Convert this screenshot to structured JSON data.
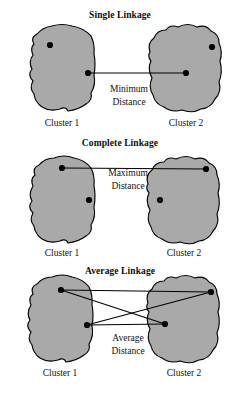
{
  "figure": {
    "background_color": "#ffffff",
    "blob_fill_color": "#a9a9a9",
    "blob_stroke_color": "#000000",
    "line_color": "#000000",
    "point_color": "#000000",
    "text_color": "#111111"
  },
  "panels": [
    {
      "id": "single-linkage",
      "title": "Single Linkage",
      "distance_label_line1": "Minimum",
      "distance_label_line2": "Distance",
      "left_cluster_label": "Cluster 1",
      "right_cluster_label": "Cluster 2",
      "points": [
        {
          "name": "left-outlier-point",
          "x": 50,
          "y": 45
        },
        {
          "name": "left-nearest-point",
          "x": 88,
          "y": 73
        },
        {
          "name": "right-nearest-point",
          "x": 186,
          "y": 73
        },
        {
          "name": "right-outlier-point",
          "x": 212,
          "y": 47
        }
      ],
      "connections": [
        {
          "name": "minimum-distance-line",
          "x1": 88,
          "y1": 73,
          "x2": 186,
          "y2": 73
        }
      ]
    },
    {
      "id": "complete-linkage",
      "title": "Complete Linkage",
      "distance_label_line1": "Maximum",
      "distance_label_line2": "Distance",
      "left_cluster_label": "Cluster 1",
      "right_cluster_label": "Cluster 2",
      "points": [
        {
          "name": "left-farthest-point",
          "x": 62,
          "y": 168
        },
        {
          "name": "left-inner-point",
          "x": 89,
          "y": 200
        },
        {
          "name": "right-inner-point",
          "x": 160,
          "y": 200
        },
        {
          "name": "right-farthest-point",
          "x": 206,
          "y": 169
        }
      ],
      "connections": [
        {
          "name": "maximum-distance-line",
          "x1": 62,
          "y1": 168,
          "x2": 206,
          "y2": 169
        }
      ]
    },
    {
      "id": "average-linkage",
      "title": "Average Linkage",
      "distance_label_line1": "Average",
      "distance_label_line2": "Distance",
      "left_cluster_label": "Cluster 1",
      "right_cluster_label": "Cluster 2",
      "points": [
        {
          "name": "left-top-point",
          "x": 61,
          "y": 290
        },
        {
          "name": "left-bottom-point",
          "x": 87,
          "y": 325
        },
        {
          "name": "right-bottom-point",
          "x": 165,
          "y": 324
        },
        {
          "name": "right-top-point",
          "x": 211,
          "y": 292
        }
      ],
      "connections": [
        {
          "name": "pair-line-top-top",
          "x1": 61,
          "y1": 290,
          "x2": 211,
          "y2": 292
        },
        {
          "name": "pair-line-top-bottom",
          "x1": 61,
          "y1": 290,
          "x2": 165,
          "y2": 324
        },
        {
          "name": "pair-line-bottom-top",
          "x1": 87,
          "y1": 325,
          "x2": 211,
          "y2": 292
        },
        {
          "name": "pair-line-bottom-bottom",
          "x1": 87,
          "y1": 325,
          "x2": 165,
          "y2": 324
        }
      ]
    }
  ],
  "geometry": {
    "point_radius": 3.1,
    "blob_paths": {
      "single_left": "M 33 55 Q 30 48 34 44 Q 30 38 37 34 Q 43 27 52 26 Q 62 23 72 26 Q 84 28 91 36 Q 95 44 94 54 Q 96 64 94 75 Q 96 85 91 93 Q 93 100 86 104 Q 78 110 68 111 Q 66 106 60 109 Q 50 112 42 107 Q 35 102 34 94 Q 29 88 33 81 Q 27 75 32 69 Q 28 62 33 55 Z",
      "single_right": "M 150 52 Q 147 43 154 38 Q 157 30 166 30 Q 170 24 178 27 Q 188 22 197 27 Q 206 24 211 31 Q 219 34 219 43 Q 223 52 220 61 Q 223 72 219 82 Q 222 92 215 99 Q 211 108 201 109 Q 192 114 182 110 Q 172 113 164 107 Q 155 104 153 95 Q 148 87 152 78 Q 147 69 151 61 Q 147 56 150 52 Z",
      "complete_left": "M 33 186 Q 30 179 35 175 Q 32 168 39 165 Q 45 158 54 158 Q 64 154 74 158 Q 85 160 91 168 Q 95 176 94 186 Q 96 196 94 207 Q 96 217 91 225 Q 93 232 86 236 Q 78 242 68 243 Q 66 238 60 241 Q 50 244 42 239 Q 35 234 34 226 Q 29 220 33 213 Q 27 207 32 201 Q 28 194 33 186 Z",
      "complete_right": "M 148 184 Q 145 175 152 170 Q 155 162 164 162 Q 168 156 176 159 Q 186 154 195 159 Q 204 156 209 163 Q 217 166 217 175 Q 221 184 218 193 Q 221 204 217 214 Q 220 224 213 231 Q 209 240 199 241 Q 190 246 180 242 Q 170 245 162 239 Q 153 236 151 227 Q 146 219 150 210 Q 145 201 149 193 Q 145 188 148 184 Z",
      "average_left": "M 31 305 Q 28 298 33 294 Q 30 287 37 284 Q 43 277 52 277 Q 62 273 72 277 Q 83 279 89 287 Q 93 295 92 305 Q 94 315 92 326 Q 94 336 89 344 Q 91 351 84 355 Q 76 361 66 362 Q 64 357 58 360 Q 48 363 40 358 Q 33 353 32 345 Q 27 339 31 332 Q 25 326 30 320 Q 26 313 31 305 Z",
      "average_right": "M 148 303 Q 145 294 152 289 Q 155 281 164 281 Q 168 275 176 278 Q 186 273 195 278 Q 204 275 209 282 Q 217 285 217 294 Q 221 303 218 312 Q 221 323 217 333 Q 220 343 213 350 Q 209 359 199 360 Q 190 365 180 361 Q 170 364 162 358 Q 153 355 151 346 Q 146 338 150 329 Q 145 320 149 312 Q 145 307 148 303 Z"
    },
    "title_positions": [
      {
        "x": 120,
        "y": 18
      },
      {
        "x": 120,
        "y": 146
      },
      {
        "x": 120,
        "y": 274
      }
    ],
    "distance_text_positions": [
      {
        "x": 129,
        "y": 92,
        "x2": 129,
        "y2": 105
      },
      {
        "x": 128,
        "y": 176,
        "x2": 128,
        "y2": 189
      },
      {
        "x": 128,
        "y": 341,
        "x2": 128,
        "y2": 354
      }
    ],
    "cluster_label_positions": [
      {
        "left_x": 62,
        "left_y": 126,
        "right_x": 186,
        "right_y": 126
      },
      {
        "left_x": 62,
        "left_y": 256,
        "right_x": 184,
        "right_y": 256
      },
      {
        "left_x": 60,
        "left_y": 376,
        "right_x": 184,
        "right_y": 376
      }
    ]
  }
}
